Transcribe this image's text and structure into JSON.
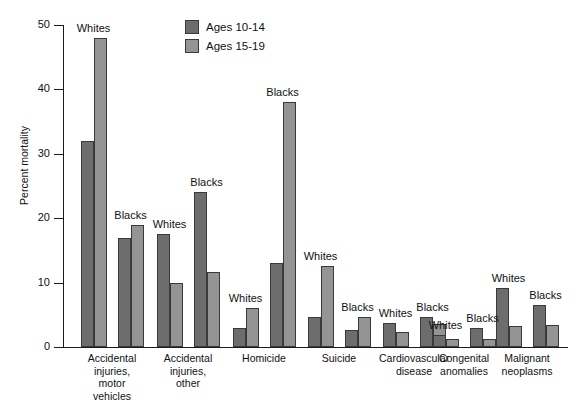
{
  "chart_data": {
    "type": "bar",
    "title": "",
    "xlabel": "",
    "ylabel": "Percent mortality",
    "ylim": [
      0,
      50
    ],
    "yticks": [
      0,
      10,
      20,
      30,
      40,
      50
    ],
    "ytick_labels": [
      "0",
      "10",
      "20",
      "30",
      "40",
      "50"
    ],
    "grid": false,
    "legend_position": "top-center",
    "legend": [
      "Ages 10-14",
      "Ages 15-19"
    ],
    "series": [
      {
        "name": "Ages 10-14",
        "color": "#6d6d6d"
      },
      {
        "name": "Ages 15-19",
        "color": "#949494"
      }
    ],
    "categories": [
      "Accidental injuries, motor vehicles",
      "Accidental injuries, other",
      "Homicide",
      "Suicide",
      "Cardiovascular disease",
      "Congenital anomalies",
      "Malignant neoplasms"
    ],
    "category_labels": [
      "Accidental\ninjuries,\nmotor\nvehicles",
      "Accidental\ninjuries,\nother",
      "Homicide",
      "Suicide",
      "Cardiovascular\ndisease",
      "Congenital\nanomalies",
      "Malignant\nneoplasms"
    ],
    "subgroups": [
      "Whites",
      "Blacks"
    ],
    "groups": [
      {
        "category": "Accidental injuries, motor vehicles",
        "label": "Accidental\ninjuries,\nmotor\nvehicles",
        "center": 112,
        "subgroups": [
          {
            "race": "Whites",
            "values": [
              32.0,
              48.0
            ]
          },
          {
            "race": "Blacks",
            "values": [
              17.0,
              19.0
            ]
          }
        ]
      },
      {
        "category": "Accidental injuries, other",
        "label": "Accidental\ninjuries,\nother",
        "center": 188,
        "subgroups": [
          {
            "race": "Whites",
            "values": [
              17.5,
              10.0
            ]
          },
          {
            "race": "Blacks",
            "values": [
              24.0,
              11.7
            ]
          }
        ]
      },
      {
        "category": "Homicide",
        "label": "Homicide",
        "center": 264,
        "subgroups": [
          {
            "race": "Whites",
            "values": [
              3.0,
              6.0
            ]
          },
          {
            "race": "Blacks",
            "values": [
              13.0,
              38.0
            ]
          }
        ]
      },
      {
        "category": "Suicide",
        "label": "Suicide",
        "center": 339,
        "subgroups": [
          {
            "race": "Whites",
            "values": [
              4.6,
              12.6
            ]
          },
          {
            "race": "Blacks",
            "values": [
              2.7,
              4.6
            ]
          }
        ]
      },
      {
        "category": "Cardiovascular disease",
        "label": "Cardiovascular\ndisease",
        "center": 414,
        "subgroups": [
          {
            "race": "Whites",
            "values": [
              3.7,
              2.3
            ]
          },
          {
            "race": "Blacks",
            "values": [
              4.7,
              3.5
            ]
          }
        ]
      },
      {
        "category": "Congenital anomalies",
        "label": "Congenital\nanomalies",
        "center": 464,
        "subgroups": [
          {
            "race": "Whites",
            "values": [
              1.9,
              1.2
            ]
          },
          {
            "race": "Blacks",
            "values": [
              2.9,
              1.3
            ]
          }
        ]
      },
      {
        "category": "Malignant neoplasms",
        "label": "Malignant\nneoplasms",
        "center": 527,
        "subgroups": [
          {
            "race": "Whites",
            "values": [
              9.2,
              3.3
            ]
          },
          {
            "race": "Blacks",
            "values": [
              6.5,
              3.4
            ]
          }
        ]
      }
    ]
  }
}
